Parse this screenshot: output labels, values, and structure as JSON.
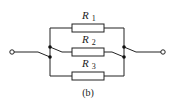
{
  "diagram": {
    "caption": "(b)",
    "resistors": [
      {
        "letter": "R",
        "sub": "1"
      },
      {
        "letter": "R",
        "sub": "2"
      },
      {
        "letter": "R",
        "sub": "3"
      }
    ],
    "colors": {
      "line": "#222222",
      "background": "#ffffff"
    }
  }
}
